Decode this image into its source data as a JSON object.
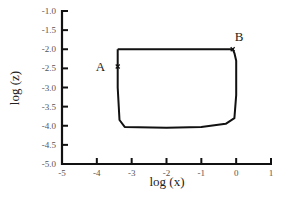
{
  "chart_data": {
    "type": "line",
    "title": "",
    "xlabel": "log (x)",
    "ylabel": "log (z)",
    "xlim": [
      -5,
      1
    ],
    "ylim": [
      -5.0,
      -1.0
    ],
    "x_ticks": [
      "-5",
      "-4",
      "-3",
      "-2",
      "-1",
      "0",
      "1"
    ],
    "y_ticks": [
      "-1.0",
      "-1.5",
      "-2.0",
      "-2.5",
      "-3.0",
      "-3.5",
      "-4.0",
      "-4.5",
      "-5.0"
    ],
    "grid": false,
    "legend": null,
    "series": [
      {
        "name": "closed cycle",
        "x": [
          -3.4,
          -3.4,
          -3.35,
          -3.2,
          -2.0,
          -1.0,
          -0.3,
          -0.05,
          0.0,
          0.0,
          -0.05,
          -0.1,
          -1.0,
          -2.0,
          -3.4
        ],
        "y": [
          -2.0,
          -3.0,
          -3.85,
          -4.03,
          -4.05,
          -4.03,
          -3.95,
          -3.8,
          -3.2,
          -2.3,
          -2.1,
          -2.0,
          -2.0,
          -2.0,
          -2.0
        ]
      }
    ],
    "annotations": [
      {
        "label": "A",
        "x": -3.4,
        "y": -2.45
      },
      {
        "label": "B",
        "x": -0.1,
        "y": -2.0
      }
    ]
  }
}
